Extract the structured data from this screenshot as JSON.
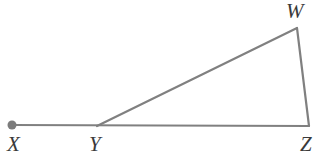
{
  "figure": {
    "kind": "geometry-diagram",
    "width": 322,
    "height": 164,
    "background_color": "#ffffff",
    "stroke_color": "#808080",
    "label_color": "#3a3a3a",
    "stroke_width": 2,
    "points": [
      {
        "id": "X",
        "label": "X",
        "x": 12,
        "y": 125,
        "marker": "filled-dot",
        "marker_radius": 4.5,
        "label_x": 13,
        "label_y": 136
      },
      {
        "id": "Y",
        "label": "Y",
        "x": 97,
        "y": 126,
        "marker": "none",
        "marker_radius": 0,
        "label_x": 92,
        "label_y": 136
      },
      {
        "id": "Z",
        "label": "Z",
        "x": 309,
        "y": 126,
        "marker": "none",
        "marker_radius": 0,
        "label_x": 303,
        "label_y": 136
      },
      {
        "id": "W",
        "label": "W",
        "x": 297,
        "y": 28,
        "marker": "none",
        "marker_radius": 0,
        "label_x": 288,
        "label_y": 2
      }
    ],
    "segments": [
      {
        "id": "XZ",
        "from": "X",
        "to": "Z",
        "name": "segment-x-z"
      },
      {
        "id": "YW",
        "from": "Y",
        "to": "W",
        "name": "segment-y-w"
      },
      {
        "id": "WZ",
        "from": "W",
        "to": "Z",
        "name": "segment-w-z"
      }
    ]
  }
}
